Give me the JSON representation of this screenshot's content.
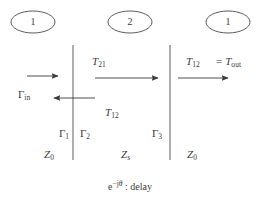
{
  "figure": {
    "background_color": "#ffffff",
    "ink_color": "#3b3b3b",
    "width": 260,
    "height": 204
  },
  "regions": [
    {
      "id": "region-left",
      "port_label": "1",
      "impedance_base": "Z",
      "impedance_sub": "0"
    },
    {
      "id": "region-middle",
      "port_label": "2",
      "impedance_base": "Z",
      "impedance_sub": "s"
    },
    {
      "id": "region-right",
      "port_label": "1",
      "impedance_base": "Z",
      "impedance_sub": "0"
    }
  ],
  "port_ellipses": [
    {
      "name": "port-ellipse-1",
      "label": "1",
      "cx": 33,
      "cy": 22
    },
    {
      "name": "port-ellipse-2",
      "label": "2",
      "cx": 130,
      "cy": 22
    },
    {
      "name": "port-ellipse-3",
      "label": "1",
      "cx": 228,
      "cy": 22
    }
  ],
  "boundaries": [
    {
      "name": "boundary-line-1",
      "x": 73,
      "y1": 45,
      "y2": 160
    },
    {
      "name": "boundary-line-2",
      "x": 170,
      "y1": 45,
      "y2": 160
    }
  ],
  "arrows": [
    {
      "name": "arrow-incident-wave",
      "direction": "right",
      "x1": 27,
      "x2": 58,
      "y": 76
    },
    {
      "name": "arrow-transmitted-into-slab",
      "direction": "right",
      "x1": 95,
      "x2": 158,
      "y": 78
    },
    {
      "name": "arrow-output-wave",
      "direction": "right",
      "x1": 178,
      "x2": 228,
      "y": 78
    },
    {
      "name": "arrow-reflected-wave",
      "direction": "left",
      "x1": 95,
      "x2": 54,
      "y": 98
    }
  ],
  "labels": {
    "gamma_in": {
      "base": "Γ",
      "sub": "in",
      "x": 18,
      "y": 92
    },
    "t21": {
      "base": "T",
      "sub": "21",
      "x": 92,
      "y": 59
    },
    "t12_left": {
      "base": "T",
      "sub": "12",
      "x": 105,
      "y": 110
    },
    "t12_right": {
      "base": "T",
      "sub": "12",
      "x": 186,
      "y": 59
    },
    "equals": {
      "text": "=",
      "x": 218,
      "y": 59
    },
    "t_out": {
      "base": "T",
      "sub": "out",
      "x": 228,
      "y": 59
    },
    "gamma_1": {
      "base": "Γ",
      "sub": "1",
      "x": 59,
      "y": 131
    },
    "gamma_2": {
      "base": "Γ",
      "sub": "2",
      "x": 85,
      "y": 131
    },
    "gamma_3": {
      "base": "Γ",
      "sub": "3",
      "x": 157,
      "y": 131
    },
    "z0_left": {
      "base": "Z",
      "sub": "0",
      "x": 49,
      "y": 152
    },
    "zs_middle": {
      "base": "Z",
      "sub": "s",
      "x": 126,
      "y": 152
    },
    "z0_right": {
      "base": "Z",
      "sub": "0",
      "x": 192,
      "y": 152
    }
  },
  "caption": {
    "base": "e",
    "exponent_minus": "−",
    "exponent_j": "j",
    "exponent_theta": "θ",
    "separator": " : ",
    "text": "delay",
    "x": 130,
    "y": 186
  }
}
